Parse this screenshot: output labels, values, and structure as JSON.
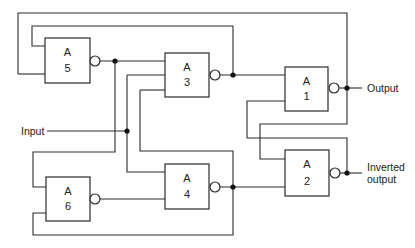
{
  "diagram": {
    "title": "",
    "gates": [
      {
        "id": "A1",
        "name_line": "A",
        "number": "1",
        "x": 285,
        "y": 67,
        "w": 43,
        "h": 44,
        "bubble": {
          "cx": 334,
          "cy": 88
        }
      },
      {
        "id": "A2",
        "name_line": "A",
        "number": "2",
        "x": 285,
        "y": 150,
        "w": 44,
        "h": 46,
        "bubble": {
          "cx": 335,
          "cy": 173
        }
      },
      {
        "id": "A3",
        "name_line": "A",
        "number": "3",
        "x": 165,
        "y": 53,
        "w": 44,
        "h": 44,
        "bubble": {
          "cx": 215,
          "cy": 75
        }
      },
      {
        "id": "A4",
        "name_line": "A",
        "number": "4",
        "x": 165,
        "y": 164,
        "w": 44,
        "h": 45,
        "bubble": {
          "cx": 215,
          "cy": 187
        }
      },
      {
        "id": "A5",
        "name_line": "A",
        "number": "5",
        "x": 45,
        "y": 38,
        "w": 45,
        "h": 45,
        "bubble": {
          "cx": 95,
          "cy": 61
        }
      },
      {
        "id": "A6",
        "name_line": "A",
        "number": "6",
        "x": 46,
        "y": 177,
        "w": 44,
        "h": 44,
        "bubble": {
          "cx": 95,
          "cy": 199
        }
      }
    ],
    "labels": {
      "input": "Input",
      "output": "Output",
      "inverted_output_line1": "Inverted",
      "inverted_output_line2": "output"
    },
    "junctions": [
      {
        "cx": 115,
        "cy": 61
      },
      {
        "cx": 233,
        "cy": 75
      },
      {
        "cx": 347,
        "cy": 88
      },
      {
        "cx": 127,
        "cy": 131
      },
      {
        "cx": 233,
        "cy": 187
      },
      {
        "cx": 347,
        "cy": 173
      }
    ],
    "wires": [
      "M 18 74 L 45 74",
      "M 18 74 L 18 13 L 347 13 L 347 124 L 260 124 L 260 159 L 285 159",
      "M 45 46 L 32 46 L 32 26 L 233 26 L 233 75",
      "M 100 61 L 165 61",
      "M 115 61 L 115 152 L 33 152 L 33 187 L 46 187",
      "M 220 75 L 285 75",
      "M 47 131 L 127 131",
      "M 127 75 L 165 75",
      "M 127 75 L 127 172 L 165 172",
      "M 140 90 L 165 90",
      "M 140 90 L 140 151 L 233 151 L 233 235 L 33 235 L 33 213 L 46 213",
      "M 100 199 L 165 199",
      "M 220 187 L 285 187",
      "M 285 101 L 247 101 L 247 138 L 347 138 L 347 173",
      "M 339 88 L 362 88",
      "M 340 173 L 362 173"
    ]
  }
}
